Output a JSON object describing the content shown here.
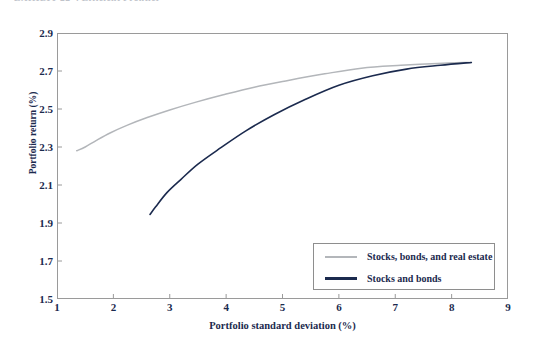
{
  "exhibit": {
    "caption": "EXHIBIT 22-4   Efficient Frontier"
  },
  "colors": {
    "series_light": "#b3b6ba",
    "series_dark": "#1b2a4e",
    "axis": "#9a9a9a",
    "text": "#1b2a4e",
    "background": "#ffffff"
  },
  "chart_data": {
    "type": "line",
    "title": "",
    "xlabel": "Portfolio standard deviation (%)",
    "ylabel": "Portfolio return (%)",
    "xlim": [
      1,
      9
    ],
    "ylim": [
      1.5,
      2.9
    ],
    "xticks": [
      1,
      2,
      3,
      4,
      5,
      6,
      7,
      8,
      9
    ],
    "yticks": [
      1.5,
      1.7,
      1.9,
      2.1,
      2.3,
      2.5,
      2.7,
      2.9
    ],
    "xtick_labels": [
      "1",
      "2",
      "3",
      "4",
      "5",
      "6",
      "7",
      "8",
      "9"
    ],
    "ytick_labels": [
      "1.5",
      "1.7",
      "1.9",
      "2.1",
      "2.3",
      "2.5",
      "2.7",
      "2.9"
    ],
    "grid": false,
    "legend_position": "lower-right",
    "series": [
      {
        "name": "Stocks, bonds, and real estate",
        "color": "#b3b6ba",
        "x": [
          1.35,
          1.5,
          1.7,
          1.95,
          2.25,
          2.6,
          3.0,
          3.45,
          3.95,
          4.5,
          5.1,
          5.75,
          6.4,
          7.1,
          7.75,
          8.35
        ],
        "y": [
          2.28,
          2.3,
          2.335,
          2.375,
          2.415,
          2.455,
          2.495,
          2.535,
          2.575,
          2.615,
          2.65,
          2.685,
          2.715,
          2.73,
          2.74,
          2.745
        ]
      },
      {
        "name": "Stocks and bonds",
        "color": "#1b2a4e",
        "x": [
          2.65,
          2.75,
          2.95,
          3.2,
          3.5,
          3.9,
          4.35,
          4.85,
          5.4,
          6.0,
          6.6,
          7.2,
          7.8,
          8.35
        ],
        "y": [
          1.945,
          1.985,
          2.06,
          2.13,
          2.21,
          2.295,
          2.385,
          2.47,
          2.55,
          2.625,
          2.675,
          2.71,
          2.73,
          2.745
        ]
      }
    ]
  },
  "legend": {
    "items": [
      {
        "label": "Stocks, bonds, and real estate",
        "color": "#b3b6ba"
      },
      {
        "label": "Stocks and bonds",
        "color": "#1b2a4e"
      }
    ]
  }
}
